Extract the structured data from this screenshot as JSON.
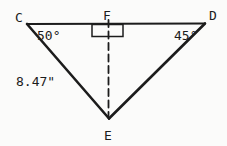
{
  "diagram": {
    "background_color": "#fbfbfa",
    "line_color": "#1c1c1c",
    "vertices": {
      "c": "C",
      "d": "D",
      "e": "E",
      "f": "F"
    },
    "angles": {
      "at_c": "50°",
      "at_d": "45°",
      "at_f": "right angle (square marker)"
    },
    "side_labels": {
      "ce": "8.47\""
    }
  }
}
